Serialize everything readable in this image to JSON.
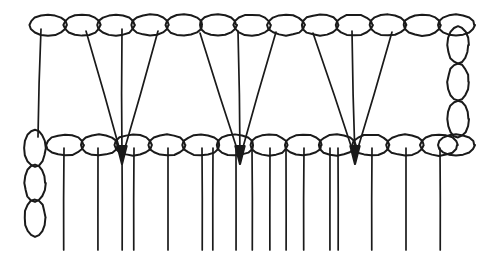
{
  "canvas": {
    "width": 492,
    "height": 264,
    "background": "#ffffff",
    "stroke_color": "#1a1a1a",
    "title": "Crochet stitch chart"
  },
  "style": {
    "chain_stroke_width": 2.0,
    "stem_stroke_width": 1.7,
    "arrow_stroke_width": 2.2
  },
  "chart_data": {
    "type": "diagram",
    "title": "Crochet stitch chart",
    "legend": [],
    "top_chain": {
      "label": "upper chain row",
      "cy": 25,
      "rx": 18.5,
      "ry": 10.5,
      "count": 13,
      "cx": [
        48,
        82,
        116,
        150,
        184,
        218,
        252,
        286,
        320,
        354,
        388,
        422,
        456
      ]
    },
    "bottom_chain": {
      "label": "lower chain row",
      "cy": 145,
      "rx": 18.5,
      "ry": 10.5,
      "count": 13,
      "cx": [
        65,
        99,
        133,
        167,
        201,
        235,
        269,
        303,
        337,
        371,
        405,
        439,
        456
      ]
    },
    "right_vertical_chain": {
      "label": "right turning chain",
      "cx": 458,
      "rx": 10.5,
      "ry": 18.5,
      "count": 3,
      "cy": [
        45,
        82,
        119
      ]
    },
    "left_vertical_chain": {
      "label": "left turning chain",
      "cx": 35,
      "rx": 10.5,
      "ry": 18.5,
      "count": 3,
      "cy": [
        148,
        183,
        218
      ]
    },
    "top_stems": {
      "label": "upper row stems descending to lower row",
      "note": "x1,y1 = start on upper chain oval; x2,y2 = end on lower chain",
      "segments": [
        {
          "x1": 41,
          "y1": 29,
          "x2": 38,
          "y2": 137,
          "kind": "plain"
        },
        {
          "x1": 86,
          "y1": 31,
          "x2": 122,
          "y2": 158,
          "kind": "cluster-1"
        },
        {
          "x1": 122,
          "y1": 29,
          "x2": 122,
          "y2": 158,
          "kind": "cluster-1"
        },
        {
          "x1": 158,
          "y1": 31,
          "x2": 122,
          "y2": 158,
          "kind": "cluster-1"
        },
        {
          "x1": 200,
          "y1": 33,
          "x2": 240,
          "y2": 158,
          "kind": "cluster-2"
        },
        {
          "x1": 238,
          "y1": 31,
          "x2": 240,
          "y2": 158,
          "kind": "cluster-2"
        },
        {
          "x1": 276,
          "y1": 32,
          "x2": 240,
          "y2": 158,
          "kind": "cluster-2"
        },
        {
          "x1": 313,
          "y1": 33,
          "x2": 355,
          "y2": 158,
          "kind": "cluster-3"
        },
        {
          "x1": 352,
          "y1": 31,
          "x2": 355,
          "y2": 158,
          "kind": "cluster-3"
        },
        {
          "x1": 392,
          "y1": 32,
          "x2": 355,
          "y2": 158,
          "kind": "cluster-3"
        }
      ]
    },
    "arrow_tips": {
      "label": "cluster convergence arrowheads",
      "points": [
        {
          "x": 122,
          "y": 160
        },
        {
          "x": 240,
          "y": 160
        },
        {
          "x": 355,
          "y": 160
        }
      ]
    },
    "bottom_stems": {
      "label": "lower row stems descending",
      "y_top": 148,
      "y_bottom": 250,
      "x": [
        64,
        98,
        122,
        134,
        168,
        202,
        213,
        236,
        252,
        270,
        286,
        304,
        330,
        338,
        372,
        406,
        440
      ]
    }
  }
}
